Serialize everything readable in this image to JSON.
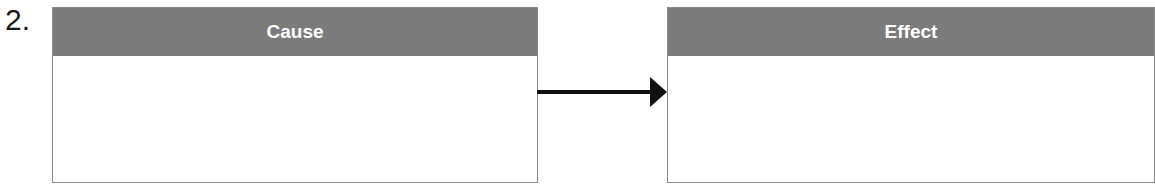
{
  "item_number": "2.",
  "cause": {
    "header": "Cause",
    "content": ""
  },
  "effect": {
    "header": "Effect",
    "content": ""
  },
  "colors": {
    "header_bg": "#7b7b7b",
    "header_text": "#ffffff",
    "border": "#8a8a8a",
    "arrow": "#111111"
  }
}
